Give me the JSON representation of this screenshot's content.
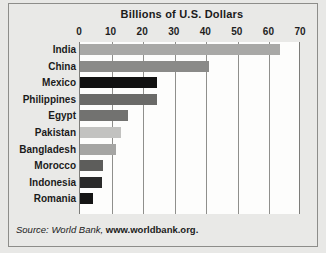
{
  "chart_data": {
    "type": "bar",
    "orientation": "horizontal",
    "title": "Billions of U.S. Dollars",
    "xlabel": "",
    "ylabel": "",
    "xlim": [
      0,
      70
    ],
    "xticks": [
      0,
      10,
      20,
      30,
      40,
      50,
      60,
      70
    ],
    "xtick_labels": [
      "0",
      "10",
      "20",
      "30",
      "40",
      "50",
      "60",
      "70"
    ],
    "grid": true,
    "legend": "none",
    "categories": [
      "India",
      "China",
      "Mexico",
      "Philippines",
      "Egypt",
      "Pakistan",
      "Bangladesh",
      "Morocco",
      "Indonesia",
      "Romania"
    ],
    "values": [
      63.5,
      41,
      24.3,
      24.3,
      15.3,
      13,
      11.5,
      7.3,
      7,
      4.2
    ],
    "bar_colors": [
      "#a8a8a6",
      "#8a8a88",
      "#111111",
      "#6a6a68",
      "#727270",
      "#c2c2c0",
      "#a5a5a3",
      "#5d5d5b",
      "#2a2a2a",
      "#151515"
    ],
    "source_prefix": "Source: World Bank,",
    "source_url": "www.worldbank.org."
  }
}
